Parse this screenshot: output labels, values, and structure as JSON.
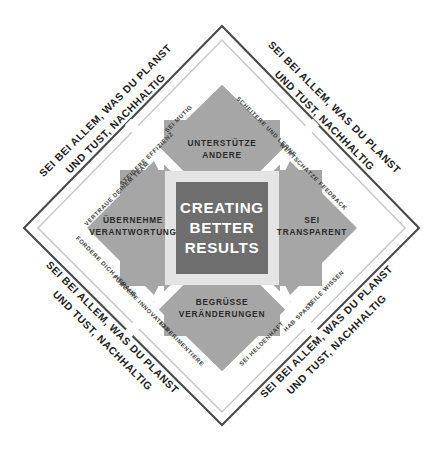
{
  "diagram": {
    "title": "CREATING BETTER RESULTS",
    "type": "diamond-framework",
    "colors": {
      "background": "#ffffff",
      "outer_frame": "#4a4a4a",
      "inner_frame": "#c9c9c9",
      "quadrant_fill": "#a6a6a6",
      "core_ring": "#e2e2e2",
      "core_fill": "#6e6e6e",
      "core_text": "#ffffff",
      "motto_text": "#1d1d1d",
      "value_text": "#3b3b3b",
      "quadrant_text": "#2a2a2a"
    },
    "core": {
      "line1": "CREATING",
      "line2": "BETTER",
      "line3": "RESULTS"
    },
    "mottos": [
      {
        "id": "motto-top-left",
        "line1": "SEI BEI ALLEM, WAS DU PLANST",
        "line2": "UND TUST, NACHHALTIG"
      },
      {
        "id": "motto-top-right",
        "line1": "SEI BEI ALLEM, WAS DU PLANST",
        "line2": "UND TUST, NACHHALTIG"
      },
      {
        "id": "motto-bottom-right",
        "line1": "SEI BEI ALLEM, WAS DU PLANST",
        "line2": "UND TUST, NACHHALTIG"
      },
      {
        "id": "motto-bottom-left",
        "line1": "SEI BEI ALLEM, WAS DU PLANST",
        "line2": "UND TUST, NACHHALTIG"
      }
    ],
    "quadrants": [
      {
        "id": "quadrant-top",
        "position": "top",
        "line1": "UNTERSTÜTZE",
        "line2": "ANDERE"
      },
      {
        "id": "quadrant-right",
        "position": "right",
        "line1": "SEI",
        "line2": "TRANSPARENT"
      },
      {
        "id": "quadrant-bottom",
        "position": "bottom",
        "line1": "BEGRÜSSE",
        "line2": "VERÄNDERUNGEN"
      },
      {
        "id": "quadrant-left",
        "position": "left",
        "line1": "ÜBERNEHME",
        "line2": "VERANTWORTUNG"
      }
    ],
    "values": [
      {
        "id": "value-vertraue-deinem-team",
        "label": "VERTRAUE DEINEM TEAM",
        "edge": "upper-left"
      },
      {
        "id": "value-steigere-effizienz",
        "label": "STEIGERE EFFIZIENZ",
        "edge": "upper-left"
      },
      {
        "id": "value-sei-mutig",
        "label": "SEI MUTIG",
        "edge": "upper-left"
      },
      {
        "id": "value-scheitere-und-lerne",
        "label": "SCHEITERE UND LERNE",
        "edge": "upper-right"
      },
      {
        "id": "value-wertschaetze-feedback",
        "label": "WERTSCHÄTZE FEEDBACK",
        "edge": "upper-right"
      },
      {
        "id": "value-teile-wissen",
        "label": "TEILE WISSEN",
        "edge": "lower-right"
      },
      {
        "id": "value-hab-spass",
        "label": "HAB SPASS",
        "edge": "lower-right"
      },
      {
        "id": "value-sei-heldenhaft",
        "label": "SEI HELDENHAFT",
        "edge": "lower-right"
      },
      {
        "id": "value-experimentiere",
        "label": "EXPERIMENTIERE",
        "edge": "lower-left"
      },
      {
        "id": "value-foerdere-innovation",
        "label": "FÖRDERE INNOVATION",
        "edge": "lower-left"
      },
      {
        "id": "value-fordere-dich-heraus",
        "label": "FORDERE DICH HERAUS",
        "edge": "lower-left"
      }
    ]
  }
}
